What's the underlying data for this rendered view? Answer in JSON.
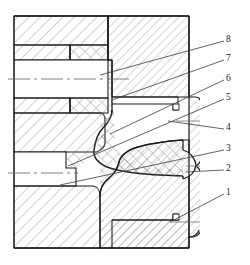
{
  "figure": {
    "type": "engineering-section-drawing",
    "canvas": {
      "width": 250,
      "height": 265
    },
    "background_color": "#ffffff",
    "line_color": "#1a1a1a",
    "hatch_color": "#8a8a8a",
    "centerline_color": "#777777"
  },
  "callouts": {
    "items": [
      {
        "label": "8",
        "text_x": 226,
        "text_y": 35,
        "leader_from_x": 224,
        "leader_from_y": 41,
        "leader_to_x": 100,
        "leader_to_y": 75
      },
      {
        "label": "7",
        "text_x": 226,
        "text_y": 54,
        "leader_from_x": 224,
        "leader_from_y": 60,
        "leader_to_x": 112,
        "leader_to_y": 100
      },
      {
        "label": "6",
        "text_x": 226,
        "text_y": 74,
        "leader_from_x": 224,
        "leader_from_y": 80,
        "leader_to_x": 110,
        "leader_to_y": 134
      },
      {
        "label": "5",
        "text_x": 226,
        "text_y": 93,
        "leader_from_x": 224,
        "leader_from_y": 99,
        "leader_to_x": 68,
        "leader_to_y": 166
      },
      {
        "label": "4",
        "text_x": 226,
        "text_y": 123,
        "leader_from_x": 224,
        "leader_from_y": 129,
        "leader_to_x": 168,
        "leader_to_y": 121
      },
      {
        "label": "3",
        "text_x": 226,
        "text_y": 144,
        "leader_from_x": 224,
        "leader_from_y": 150,
        "leader_to_x": 60,
        "leader_to_y": 185
      },
      {
        "label": "2",
        "text_x": 226,
        "text_y": 164,
        "leader_from_x": 224,
        "leader_from_y": 170,
        "leader_to_x": 186,
        "leader_to_y": 172
      },
      {
        "label": "1",
        "text_x": 226,
        "text_y": 188,
        "leader_from_x": 224,
        "leader_from_y": 194,
        "leader_to_x": 170,
        "leader_to_y": 222
      }
    ]
  },
  "geometry": {
    "outline_top": 14,
    "outline_bottom": 250,
    "outline_left": 14,
    "outline_right": 189,
    "axis_upper_y": 79,
    "axis_lower_y": 173
  }
}
